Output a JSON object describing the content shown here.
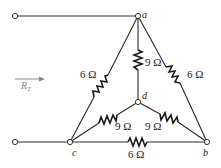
{
  "diagram": {
    "type": "resistor network (delta-wye)",
    "nodes": {
      "a": "a",
      "b": "b",
      "c": "c",
      "d": "d"
    },
    "equivalent_label": "R",
    "equivalent_subscript": "T",
    "resistors": [
      {
        "id": "R_ca",
        "from": "c",
        "to": "a",
        "label": "6 Ω"
      },
      {
        "id": "R_ab",
        "from": "a",
        "to": "b",
        "label": "6 Ω"
      },
      {
        "id": "R_cb",
        "from": "c",
        "to": "b",
        "label": "6 Ω"
      },
      {
        "id": "R_ad",
        "from": "a",
        "to": "d",
        "label": "9 Ω"
      },
      {
        "id": "R_cd",
        "from": "c",
        "to": "d",
        "label": "9 Ω"
      },
      {
        "id": "R_bd",
        "from": "b",
        "to": "d",
        "label": "9 Ω"
      }
    ],
    "colors": {
      "wire": "#2a2a2a",
      "arrow": "#7a8aa0"
    }
  }
}
